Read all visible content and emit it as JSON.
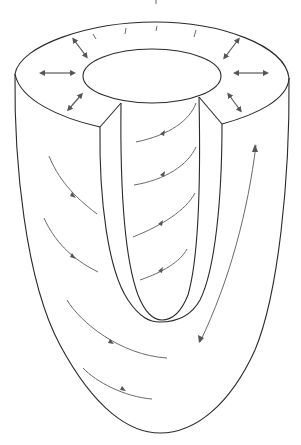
{
  "figure": {
    "title": "",
    "colors": {
      "outline": "#2a2a2a",
      "fiber_arrows": "#6a6a6a",
      "radial_arrows": "#5a5a5a",
      "background": "#ffffff"
    },
    "components": {
      "outer_wall": "epicardial surface",
      "inner_cavity": "endocardial cavity",
      "wall_cut": "cutaway section of ventricular wall",
      "base_ring": "basal rim (annulus)"
    },
    "annotations": {
      "radial_arrows_count": 6,
      "radial_arrow_meaning": "wall thickening (radial)",
      "rim_ticks_count": 4,
      "fiber_arrows_outer_count": 5,
      "fiber_arrows_inner_count": 4,
      "long_axis_arrow": "bidirectional longitudinal arrow"
    }
  }
}
